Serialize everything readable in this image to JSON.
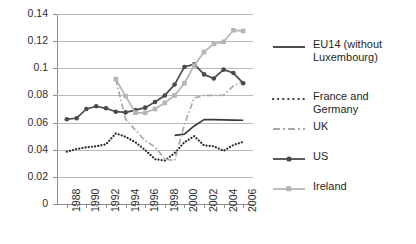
{
  "chart_data": {
    "type": "line",
    "title": "",
    "xlabel": "",
    "ylabel": "",
    "xlim": [
      1987,
      2007
    ],
    "ylim": [
      0,
      0.14
    ],
    "grid": true,
    "legend_position": "right",
    "y_ticks": [
      "0",
      "0.02",
      "0.04",
      "0.06",
      "0.08",
      "0.1",
      "0.12",
      "0.14"
    ],
    "y_tick_values": [
      0,
      0.02,
      0.04,
      0.06,
      0.08,
      0.1,
      0.12,
      0.14
    ],
    "x_ticks": [
      "1988",
      "1990",
      "1992",
      "1994",
      "1996",
      "1998",
      "2000",
      "2002",
      "2004",
      "2006"
    ],
    "x_tick_values": [
      1988,
      1990,
      1992,
      1994,
      1996,
      1998,
      2000,
      2002,
      2004,
      2006
    ],
    "series": [
      {
        "name": "EU14 (without Luxembourg)",
        "style": "solid",
        "color": "#3a3a3a",
        "marker": "none",
        "x": [
          1999,
          2000,
          2001,
          2002,
          2003,
          2004,
          2005,
          2006
        ],
        "values": [
          0.0505,
          0.0515,
          0.0575,
          0.0622,
          0.0622,
          0.062,
          0.0618,
          0.0617
        ]
      },
      {
        "name": "France and Germany",
        "style": "dotted",
        "color": "#2b2b2b",
        "marker": "none",
        "x": [
          1988,
          1989,
          1990,
          1991,
          1992,
          1993,
          1994,
          1995,
          1996,
          1997,
          1998,
          1999,
          2000,
          2001,
          2002,
          2003,
          2004,
          2005,
          2006
        ],
        "values": [
          0.0385,
          0.0405,
          0.0418,
          0.0425,
          0.044,
          0.052,
          0.0495,
          0.0455,
          0.0398,
          0.033,
          0.032,
          0.0375,
          0.0455,
          0.05,
          0.0432,
          0.0425,
          0.0392,
          0.0435,
          0.0458
        ]
      },
      {
        "name": "UK",
        "style": "dashdot",
        "color": "#a9a9a9",
        "marker": "none",
        "x": [
          1993,
          1994,
          1995,
          1996,
          1997,
          1998,
          1999,
          2000,
          2001,
          2002,
          2003,
          2004,
          2005,
          2006
        ],
        "values": [
          0.0918,
          0.0625,
          0.0545,
          0.0465,
          0.0422,
          0.033,
          0.032,
          0.0585,
          0.0782,
          0.08,
          0.08,
          0.0802,
          0.087,
          0.0905
        ]
      },
      {
        "name": "US",
        "style": "solid",
        "color": "#4a4a4a",
        "marker": "circle",
        "x": [
          1988,
          1989,
          1990,
          1991,
          1992,
          1993,
          1994,
          1995,
          1996,
          1997,
          1998,
          1999,
          2000,
          2001,
          2002,
          2003,
          2004,
          2005,
          2006
        ],
        "values": [
          0.0625,
          0.0632,
          0.07,
          0.072,
          0.0705,
          0.068,
          0.0675,
          0.0692,
          0.071,
          0.0752,
          0.08,
          0.088,
          0.101,
          0.103,
          0.0955,
          0.0925,
          0.099,
          0.0965,
          0.089
        ]
      },
      {
        "name": "Ireland",
        "style": "solid",
        "color": "#b5b5b5",
        "marker": "square",
        "x": [
          1993,
          1994,
          1995,
          1996,
          1997,
          1998,
          1999,
          2000,
          2001,
          2002,
          2003,
          2004,
          2005,
          2006
        ],
        "values": [
          0.092,
          0.0795,
          0.0672,
          0.0672,
          0.07,
          0.0745,
          0.08,
          0.089,
          0.102,
          0.112,
          0.118,
          0.1195,
          0.128,
          0.1275
        ]
      }
    ]
  },
  "legend": {
    "items": [
      {
        "label": "EU14 (without Luxembourg)"
      },
      {
        "label": "France and Germany"
      },
      {
        "label": "UK"
      },
      {
        "label": "US"
      },
      {
        "label": "Ireland"
      }
    ]
  }
}
